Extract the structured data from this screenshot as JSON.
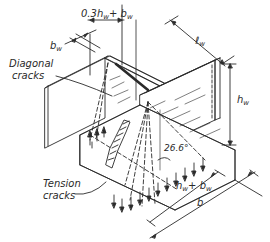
{
  "diagram": {
    "type": "isometric engineering drawing",
    "labels": {
      "diagonal_cracks_line1": "Diagonal",
      "diagonal_cracks_line2": "cracks",
      "tension_cracks_line1": "Tension",
      "tension_cracks_line2": "cracks"
    },
    "dimensions": {
      "top_offset_main": "0.3h",
      "top_offset_sub": "w",
      "top_offset_plus": "+ b",
      "top_offset_sub2": "w",
      "bw_main": "b",
      "bw_sub": "w",
      "lw_main": "ℓ",
      "lw_sub": "w",
      "hw_main": "h",
      "hw_sub": "w",
      "angle": "26.6°",
      "hw_bw_main": "h",
      "hw_bw_sub": "w",
      "hw_bw_plus": "+ b",
      "hw_bw_sub2": "w",
      "b_main": "b"
    },
    "colors": {
      "line": "#2a2a2a",
      "background": "#ffffff"
    }
  }
}
